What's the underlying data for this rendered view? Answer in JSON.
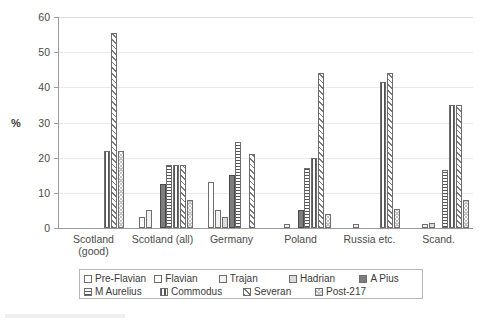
{
  "chart_data": {
    "type": "bar",
    "title": "",
    "xlabel": "",
    "ylabel": "%",
    "ylim": [
      0,
      60
    ],
    "yticks": [
      0,
      10,
      20,
      30,
      40,
      50,
      60
    ],
    "grid": true,
    "legend_position": "bottom",
    "categories": [
      "Scotland\n(good)",
      "Scotland (all)",
      "Germany",
      "Poland",
      "Russia etc.",
      "Scand."
    ],
    "series": [
      {
        "name": "Pre-Flavian",
        "pattern": "empty-white",
        "values": [
          0,
          0,
          0,
          0,
          0,
          0
        ]
      },
      {
        "name": "Flavian",
        "pattern": "empty-white",
        "values": [
          0,
          3,
          13,
          0,
          0,
          0
        ]
      },
      {
        "name": "Trajan",
        "pattern": "light-gray",
        "values": [
          0,
          5,
          5,
          1,
          1,
          1
        ]
      },
      {
        "name": "Hadrian",
        "pattern": "gray",
        "values": [
          0,
          0,
          3,
          0,
          0,
          1.5
        ]
      },
      {
        "name": "A Pius",
        "pattern": "solid-dark-gray",
        "values": [
          0,
          12.5,
          15,
          5,
          0,
          0
        ]
      },
      {
        "name": "M Aurelius",
        "pattern": "horizontal-lines",
        "values": [
          0,
          18,
          24.5,
          17,
          0,
          16.5
        ]
      },
      {
        "name": "Commodus",
        "pattern": "vertical-lines",
        "values": [
          22,
          18,
          0,
          20,
          41.5,
          35
        ]
      },
      {
        "name": "Severan",
        "pattern": "diagonal-hatch",
        "values": [
          55.5,
          18,
          21,
          44,
          44,
          35
        ]
      },
      {
        "name": "Post-217",
        "pattern": "dotted",
        "values": [
          22,
          8,
          0,
          4,
          5.5,
          8
        ]
      }
    ]
  },
  "axis": {
    "y_title": "%",
    "y_tick_labels": [
      "0",
      "10",
      "20",
      "30",
      "40",
      "50",
      "60"
    ]
  },
  "legend": {
    "items": [
      {
        "label": "Pre-Flavian",
        "swatch": "empty-white"
      },
      {
        "label": "Flavian",
        "swatch": "empty-white"
      },
      {
        "label": "Trajan",
        "swatch": "light-gray"
      },
      {
        "label": "Hadrian",
        "swatch": "gray"
      },
      {
        "label": "A Pius",
        "swatch": "solid-dark-gray"
      },
      {
        "label": "M Aurelius",
        "swatch": "horizontal-lines"
      },
      {
        "label": "Commodus",
        "swatch": "vertical-lines"
      },
      {
        "label": "Severan",
        "swatch": "diagonal-hatch"
      },
      {
        "label": "Post-217",
        "swatch": "dotted"
      }
    ]
  }
}
